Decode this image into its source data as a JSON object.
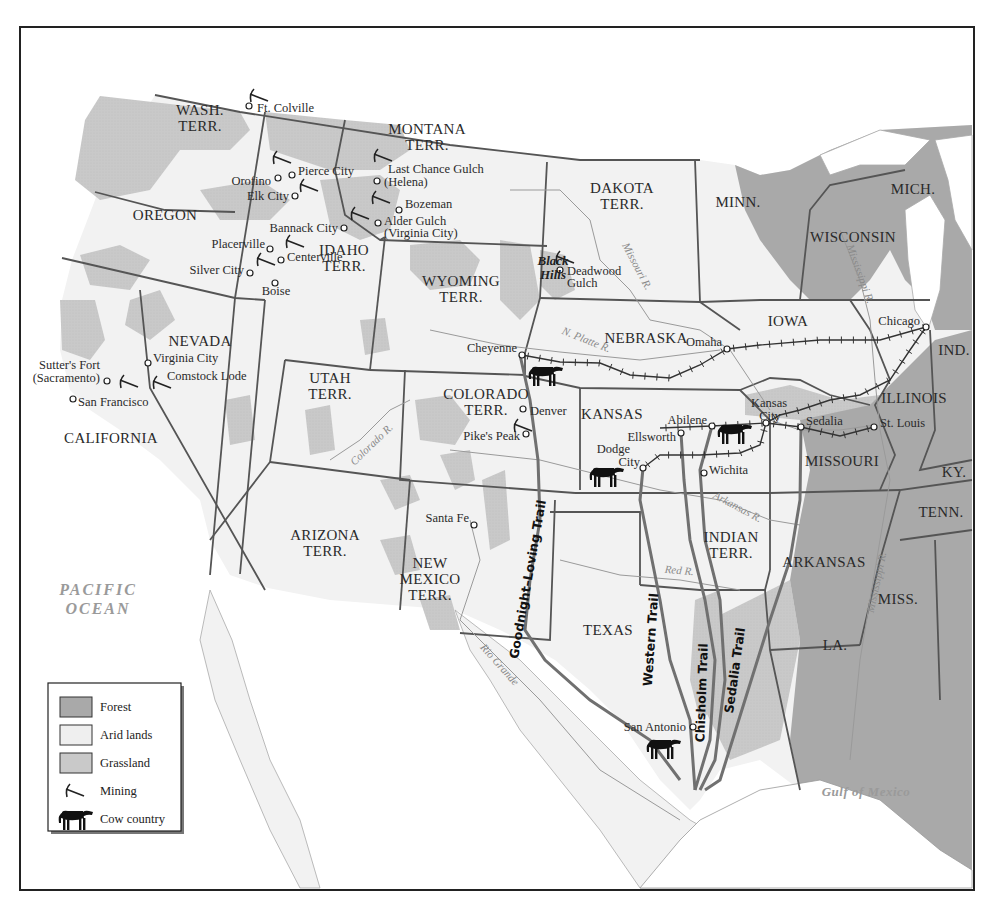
{
  "colors": {
    "background": "#ffffff",
    "land": "#f2f2f2",
    "arid": "#f6f6f6",
    "grassland": "#c9c9c9",
    "forest": "#a9a9a9",
    "water": "#ffffff",
    "border": "#555555",
    "river": "#9a9a9a",
    "trail": "#6f6f6f",
    "railroad": "#333333",
    "text": "#2a2a2a"
  },
  "legend": {
    "items": [
      {
        "key": "forest",
        "label": "Forest",
        "swatch": "#a9a9a9"
      },
      {
        "key": "arid",
        "label": "Arid lands",
        "swatch": "#efefef"
      },
      {
        "key": "grassland",
        "label": "Grassland",
        "swatch": "#c9c9c9"
      },
      {
        "key": "mining",
        "label": "Mining",
        "symbol": "pick"
      },
      {
        "key": "cow",
        "label": "Cow country",
        "symbol": "cow"
      }
    ]
  },
  "oceans": [
    {
      "name": "pacific",
      "lines": [
        "PACIFIC",
        "OCEAN"
      ],
      "x": 98,
      "y": 595,
      "size": 16
    },
    {
      "name": "gulf",
      "lines": [
        "Gulf of Mexico"
      ],
      "x": 866,
      "y": 796,
      "size": 13
    }
  ],
  "states": [
    {
      "name": "wash",
      "lines": [
        "WASH.",
        "TERR."
      ],
      "x": 200,
      "y": 115
    },
    {
      "name": "oregon",
      "lines": [
        "OREGON"
      ],
      "x": 165,
      "y": 220
    },
    {
      "name": "california",
      "lines": [
        "CALIFORNIA"
      ],
      "x": 111,
      "y": 443
    },
    {
      "name": "nevada",
      "lines": [
        "NEVADA"
      ],
      "x": 200,
      "y": 346
    },
    {
      "name": "idaho",
      "lines": [
        "IDAHO",
        "TERR."
      ],
      "x": 344,
      "y": 255
    },
    {
      "name": "montana",
      "lines": [
        "MONTANA",
        "TERR."
      ],
      "x": 427,
      "y": 134
    },
    {
      "name": "wyoming",
      "lines": [
        "WYOMING",
        "TERR."
      ],
      "x": 461,
      "y": 286
    },
    {
      "name": "utah",
      "lines": [
        "UTAH",
        "TERR."
      ],
      "x": 330,
      "y": 383
    },
    {
      "name": "colorado",
      "lines": [
        "COLORADO",
        "TERR."
      ],
      "x": 486,
      "y": 399
    },
    {
      "name": "arizona",
      "lines": [
        "ARIZONA",
        "TERR."
      ],
      "x": 325,
      "y": 540
    },
    {
      "name": "new-mexico",
      "lines": [
        "NEW",
        "MEXICO",
        "TERR."
      ],
      "x": 430,
      "y": 568
    },
    {
      "name": "dakota",
      "lines": [
        "DAKOTA",
        "TERR."
      ],
      "x": 622,
      "y": 193
    },
    {
      "name": "nebraska",
      "lines": [
        "NEBRASKA"
      ],
      "x": 646,
      "y": 343
    },
    {
      "name": "kansas",
      "lines": [
        "KANSAS"
      ],
      "x": 612,
      "y": 419
    },
    {
      "name": "indian",
      "lines": [
        "INDIAN",
        "TERR."
      ],
      "x": 731,
      "y": 542
    },
    {
      "name": "texas",
      "lines": [
        "TEXAS"
      ],
      "x": 608,
      "y": 635
    },
    {
      "name": "minn",
      "lines": [
        "MINN."
      ],
      "x": 738,
      "y": 207
    },
    {
      "name": "iowa",
      "lines": [
        "IOWA"
      ],
      "x": 788,
      "y": 326
    },
    {
      "name": "missouri",
      "lines": [
        "MISSOURI"
      ],
      "x": 842,
      "y": 466
    },
    {
      "name": "arkansas",
      "lines": [
        "ARKANSAS"
      ],
      "x": 824,
      "y": 567
    },
    {
      "name": "la",
      "lines": [
        "LA."
      ],
      "x": 835,
      "y": 650
    },
    {
      "name": "wisconsin",
      "lines": [
        "WISCONSIN"
      ],
      "x": 853,
      "y": 242
    },
    {
      "name": "mich",
      "lines": [
        "MICH."
      ],
      "x": 913,
      "y": 194
    },
    {
      "name": "illinois",
      "lines": [
        "ILLINOIS"
      ],
      "x": 914,
      "y": 403
    },
    {
      "name": "ind",
      "lines": [
        "IND."
      ],
      "x": 954,
      "y": 355
    },
    {
      "name": "ky",
      "lines": [
        "KY."
      ],
      "x": 954,
      "y": 477
    },
    {
      "name": "tenn",
      "lines": [
        "TENN."
      ],
      "x": 941,
      "y": 517
    },
    {
      "name": "miss",
      "lines": [
        "MISS."
      ],
      "x": 898,
      "y": 604
    }
  ],
  "regions": [
    {
      "name": "black-hills",
      "lines": [
        "Black",
        "Hills"
      ],
      "x": 553,
      "y": 265
    }
  ],
  "towns": [
    {
      "name": "ft-colville",
      "label": "Ft. Colville",
      "x": 249,
      "y": 106,
      "lx": 257,
      "ly": 112,
      "anchor": "start"
    },
    {
      "name": "pierce-city",
      "label": "Pierce City",
      "x": 292,
      "y": 175,
      "lx": 298,
      "ly": 175,
      "anchor": "start"
    },
    {
      "name": "orofino",
      "label": "Orofino",
      "x": 278,
      "y": 178,
      "lx": 271,
      "ly": 185,
      "anchor": "end"
    },
    {
      "name": "elk-city",
      "label": "Elk City",
      "x": 295,
      "y": 196,
      "lx": 289,
      "ly": 200,
      "anchor": "end"
    },
    {
      "name": "last-chance",
      "label": "Last Chance Gulch",
      "x": 377,
      "y": 181,
      "lx": 388,
      "ly": 173,
      "anchor": "start"
    },
    {
      "name": "helena",
      "label": "(Helena)",
      "x": 377,
      "y": 181,
      "lx": 384,
      "ly": 186,
      "anchor": "start"
    },
    {
      "name": "bozeman",
      "label": "Bozeman",
      "x": 399,
      "y": 210,
      "lx": 405,
      "ly": 208,
      "anchor": "start"
    },
    {
      "name": "alder-gulch",
      "label": "Alder Gulch",
      "x": 378,
      "y": 223,
      "lx": 384,
      "ly": 225,
      "anchor": "start"
    },
    {
      "name": "virginia-city-mt",
      "label": "(Virginia City)",
      "x": 378,
      "y": 223,
      "lx": 384,
      "ly": 237,
      "anchor": "start"
    },
    {
      "name": "bannack-city",
      "label": "Bannack City",
      "x": 344,
      "y": 228,
      "lx": 338,
      "ly": 232,
      "anchor": "end"
    },
    {
      "name": "placerville",
      "label": "Placerville",
      "x": 270,
      "y": 249,
      "lx": 265,
      "ly": 248,
      "anchor": "end"
    },
    {
      "name": "centerville",
      "label": "Centerville",
      "x": 281,
      "y": 260,
      "lx": 287,
      "ly": 261,
      "anchor": "start"
    },
    {
      "name": "silver-city",
      "label": "Silver City",
      "x": 250,
      "y": 273,
      "lx": 244,
      "ly": 274,
      "anchor": "end"
    },
    {
      "name": "boise",
      "label": "Boise",
      "x": 275,
      "y": 283,
      "lx": 276,
      "ly": 295,
      "anchor": "middle"
    },
    {
      "name": "deadwood-gulch",
      "label": "Deadwood",
      "x": 560,
      "y": 270,
      "lx": 567,
      "ly": 275,
      "anchor": "start"
    },
    {
      "name": "deadwood-gulch-2",
      "label": "Gulch",
      "x": 560,
      "y": 270,
      "lx": 567,
      "ly": 287,
      "anchor": "start"
    },
    {
      "name": "virginia-city-nv",
      "label": "Virginia City",
      "x": 148,
      "y": 363,
      "lx": 153,
      "ly": 362,
      "anchor": "start"
    },
    {
      "name": "comstock-lode",
      "label": "Comstock Lode",
      "x": 148,
      "y": 363,
      "lx": 167,
      "ly": 380,
      "anchor": "start"
    },
    {
      "name": "sutters-fort",
      "label": "Sutter's Fort",
      "x": 107,
      "y": 381,
      "lx": 100,
      "ly": 369,
      "anchor": "end"
    },
    {
      "name": "sacramento",
      "label": "(Sacramento)",
      "x": 107,
      "y": 381,
      "lx": 100,
      "ly": 382,
      "anchor": "end"
    },
    {
      "name": "san-francisco",
      "label": "San  Francisco",
      "x": 73,
      "y": 399,
      "lx": 78,
      "ly": 406,
      "anchor": "start"
    },
    {
      "name": "cheyenne",
      "label": "Cheyenne",
      "x": 522,
      "y": 355,
      "lx": 517,
      "ly": 352,
      "anchor": "end"
    },
    {
      "name": "denver",
      "label": "Denver",
      "x": 523,
      "y": 409,
      "lx": 530,
      "ly": 415,
      "anchor": "start"
    },
    {
      "name": "pikes-peak",
      "label": "Pike's Peak",
      "x": 526,
      "y": 434,
      "lx": 520,
      "ly": 440,
      "anchor": "end"
    },
    {
      "name": "santa-fe",
      "label": "Santa Fe",
      "x": 474,
      "y": 525,
      "lx": 469,
      "ly": 522,
      "anchor": "end"
    },
    {
      "name": "omaha",
      "label": "Omaha",
      "x": 727,
      "y": 349,
      "lx": 722,
      "ly": 346,
      "anchor": "end"
    },
    {
      "name": "chicago",
      "label": "Chicago",
      "x": 926,
      "y": 327,
      "lx": 920,
      "ly": 325,
      "anchor": "end"
    },
    {
      "name": "abilene",
      "label": "Abilene",
      "x": 712,
      "y": 426,
      "lx": 707,
      "ly": 424,
      "anchor": "end"
    },
    {
      "name": "kansas-city",
      "label": "Kansas",
      "x": 766,
      "y": 423,
      "lx": 769,
      "ly": 407,
      "anchor": "middle"
    },
    {
      "name": "kansas-city-2",
      "label": "City",
      "x": 766,
      "y": 423,
      "lx": 770,
      "ly": 420,
      "anchor": "middle"
    },
    {
      "name": "sedalia",
      "label": "Sedalia",
      "x": 801,
      "y": 427,
      "lx": 806,
      "ly": 425,
      "anchor": "start"
    },
    {
      "name": "st-louis",
      "label": "St. Louis",
      "x": 874,
      "y": 427,
      "lx": 880,
      "ly": 427,
      "anchor": "start"
    },
    {
      "name": "ellsworth",
      "label": "Ellsworth",
      "x": 681,
      "y": 433,
      "lx": 676,
      "ly": 441,
      "anchor": "end"
    },
    {
      "name": "dodge-city",
      "label": "Dodge",
      "x": 643,
      "y": 468,
      "lx": 630,
      "ly": 453,
      "anchor": "end"
    },
    {
      "name": "dodge-city-2",
      "label": "City",
      "x": 643,
      "y": 468,
      "lx": 640,
      "ly": 466,
      "anchor": "end"
    },
    {
      "name": "wichita",
      "label": "Wichita",
      "x": 704,
      "y": 473,
      "lx": 709,
      "ly": 474,
      "anchor": "start"
    },
    {
      "name": "san-antonio",
      "label": "San Antonio",
      "x": 693,
      "y": 727,
      "lx": 686,
      "ly": 731,
      "anchor": "end"
    }
  ],
  "mines": [
    {
      "x": 250,
      "y": 94
    },
    {
      "x": 273,
      "y": 156
    },
    {
      "x": 300,
      "y": 184
    },
    {
      "x": 374,
      "y": 154
    },
    {
      "x": 372,
      "y": 196
    },
    {
      "x": 351,
      "y": 212
    },
    {
      "x": 286,
      "y": 240
    },
    {
      "x": 257,
      "y": 258
    },
    {
      "x": 556,
      "y": 256
    },
    {
      "x": 120,
      "y": 380
    },
    {
      "x": 153,
      "y": 381
    },
    {
      "x": 514,
      "y": 424
    }
  ],
  "cows": [
    {
      "x": 545,
      "y": 376
    },
    {
      "x": 606,
      "y": 477
    },
    {
      "x": 734,
      "y": 434
    },
    {
      "x": 663,
      "y": 749
    }
  ],
  "rivers": [
    {
      "name": "missouri-r",
      "label": "Missouri R.",
      "x": 634,
      "y": 268,
      "rotate": 62
    },
    {
      "name": "n-platte-r",
      "label": "N. Platte R.",
      "x": 585,
      "y": 343,
      "rotate": 22
    },
    {
      "name": "colorado-r",
      "label": "Colorado R.",
      "x": 374,
      "y": 447,
      "rotate": -44
    },
    {
      "name": "arkansas-r",
      "label": "Arkansas R.",
      "x": 736,
      "y": 510,
      "rotate": 28
    },
    {
      "name": "red-r",
      "label": "Red R.",
      "x": 679,
      "y": 574,
      "rotate": 5
    },
    {
      "name": "rio-grande",
      "label": "Rio Grande",
      "x": 497,
      "y": 667,
      "rotate": 48
    },
    {
      "name": "mississippi-r-n",
      "label": "Mississippi R.",
      "x": 857,
      "y": 275,
      "rotate": 70
    },
    {
      "name": "mississippi-r-s",
      "label": "Mississippi R.",
      "x": 880,
      "y": 583,
      "rotate": -78
    }
  ],
  "trails": [
    {
      "name": "goodnight-loving",
      "label": "Goodnight–Loving Trail",
      "x": 532,
      "y": 580,
      "rotate": -80
    },
    {
      "name": "western",
      "label": "Western Trail",
      "x": 655,
      "y": 640,
      "rotate": -86
    },
    {
      "name": "chisholm",
      "label": "Chisholm Trail",
      "x": 706,
      "y": 693,
      "rotate": -88
    },
    {
      "name": "sedalia",
      "label": "Sedalia Trail",
      "x": 739,
      "y": 671,
      "rotate": -82
    }
  ]
}
